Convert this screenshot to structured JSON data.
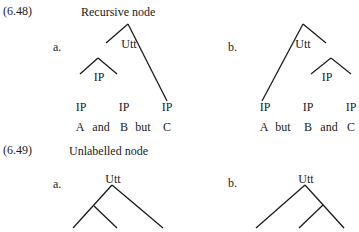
{
  "examples": [
    {
      "number": "(6.48)",
      "title": "Recursive node",
      "a": {
        "label": "a.",
        "root": "Utt",
        "mid": "IP",
        "leaves": [
          "IP",
          "IP",
          "IP"
        ],
        "words": [
          "A",
          "and",
          "B",
          "but",
          "C"
        ]
      },
      "b": {
        "label": "b.",
        "root": "Utt",
        "mid": "IP",
        "leaves": [
          "IP",
          "IP",
          "IP"
        ],
        "words": [
          "A",
          "but",
          "B",
          "and",
          "C"
        ]
      }
    },
    {
      "number": "(6.49)",
      "title": "Unlabelled node",
      "a": {
        "label": "a.",
        "root": "Utt"
      },
      "b": {
        "label": "b.",
        "root": "Utt"
      }
    }
  ]
}
